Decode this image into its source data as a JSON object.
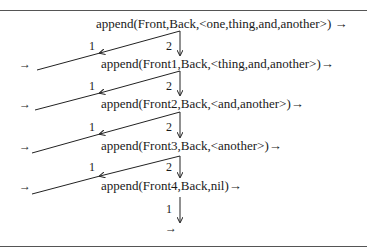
{
  "diagram": {
    "title": "",
    "goals": [
      {
        "text": "append(Front,Back,<one,thing,and,another>) →",
        "x": 96,
        "y": 17
      },
      {
        "text": "append(Front1,Back,<thing,and,another>)→",
        "x": 101,
        "y": 57
      },
      {
        "text": "append(Front2,Back,<and,another>)→",
        "x": 101,
        "y": 97
      },
      {
        "text": "append(Front3,Back,<another>)→",
        "x": 101,
        "y": 139
      },
      {
        "text": "append(Front4,Back,nil)→",
        "x": 101,
        "y": 179
      }
    ],
    "branch_labels": [
      {
        "text": "1",
        "x": 89,
        "y": 40
      },
      {
        "text": "2",
        "x": 166,
        "y": 40
      },
      {
        "text": "1",
        "x": 89,
        "y": 80
      },
      {
        "text": "2",
        "x": 166,
        "y": 80
      },
      {
        "text": "1",
        "x": 89,
        "y": 121
      },
      {
        "text": "2",
        "x": 166,
        "y": 121
      },
      {
        "text": "1",
        "x": 89,
        "y": 161
      },
      {
        "text": "2",
        "x": 166,
        "y": 161
      },
      {
        "text": "1",
        "x": 166,
        "y": 203
      }
    ],
    "left_arrows": [
      {
        "text": "→",
        "x": 19,
        "y": 58
      },
      {
        "text": "→",
        "x": 19,
        "y": 98
      },
      {
        "text": "→",
        "x": 19,
        "y": 140
      },
      {
        "text": "→",
        "x": 19,
        "y": 180
      }
    ],
    "final_arrow": {
      "text": "→",
      "x": 165,
      "y": 222
    }
  }
}
